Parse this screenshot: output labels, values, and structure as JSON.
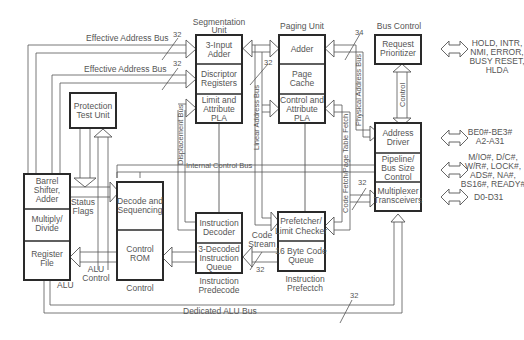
{
  "diagram": {
    "type": "block-diagram",
    "units": {
      "segmentation": {
        "title": [
          "Segmentation",
          "Unit"
        ],
        "blocks": [
          [
            "3-Input",
            "Adder"
          ],
          [
            "Discriptor",
            "Registers"
          ],
          [
            "Limit and",
            "Attribute",
            "PLA"
          ]
        ]
      },
      "paging": {
        "title": [
          "Paging Unit"
        ],
        "blocks": [
          [
            "Adder"
          ],
          [
            "Page",
            "Cache"
          ],
          [
            "Control and",
            "Attribute",
            "PLA"
          ]
        ]
      },
      "bus_control": {
        "title": [
          "Bus Control"
        ],
        "blocks": [
          [
            "Request",
            "Prioritizer"
          ],
          [
            "Address",
            "Driver"
          ],
          [
            "Pipeline/",
            "Bus Size",
            "Control"
          ],
          [
            "Multiplexer",
            "Transceivers"
          ]
        ]
      },
      "protection": {
        "blocks": [
          [
            "Protection",
            "Test Unit"
          ]
        ]
      },
      "alu": {
        "blocks": [
          [
            "Barrel",
            "Shifter,",
            "Adder"
          ],
          [
            "Multiply/",
            "Divide"
          ],
          [
            "Register",
            "File"
          ]
        ]
      },
      "control": {
        "title": [
          "Control"
        ],
        "blocks": [
          [
            "Decode and",
            "Sequencing"
          ],
          [
            "Control",
            "ROM"
          ]
        ]
      },
      "predecode": {
        "title": [
          "Instruction",
          "Predecode"
        ],
        "blocks": [
          [
            "Instruction",
            "Decoder"
          ],
          [
            "3-Decoded",
            "Instruction",
            "Queue"
          ]
        ]
      },
      "prefetch": {
        "title": [
          "Instruction",
          "Prefectch"
        ],
        "blocks": [
          [
            "Prefetcher/",
            "Limit Checker"
          ],
          [
            "16 Byte Code",
            "Queue"
          ]
        ]
      }
    },
    "bus_labels": {
      "eab1": "Effective Address Bus",
      "eab2": "Effective Address Bus",
      "internal_control": "Internal Control Bus",
      "displacement": "Displacement Bus",
      "linear_address": "Linear Address Bus",
      "physical_address": "Physical Address Bus",
      "code_fetch": "Code Fetch/Page Table Fetch",
      "control": "Control",
      "dedicated_alu": "Dedicated ALU Bus",
      "status_flags": [
        "Status",
        "Flags"
      ],
      "alu_control": [
        "ALU",
        "Control"
      ],
      "alu": "ALU",
      "code_stream": [
        "Code",
        "Stream"
      ]
    },
    "bus_widths": {
      "eab1": "32",
      "eab2": "32",
      "linear": "32",
      "physical": "34",
      "mux": "32",
      "code_stream": "32",
      "dedicated_alu": "32"
    },
    "external_signals": {
      "prioritizer": [
        "HOLD, INTR,",
        "NMI, ERROR,",
        "BUSY RESET,",
        "HLDA"
      ],
      "address": [
        "BE0#-BE3#",
        "A2-A31"
      ],
      "pipeline": [
        "M/IO#, D/C#,",
        "W/R#, LOCK#,",
        "ADS#, NA#,",
        "BS16#, READY#"
      ],
      "data": [
        "D0-D31"
      ]
    }
  }
}
